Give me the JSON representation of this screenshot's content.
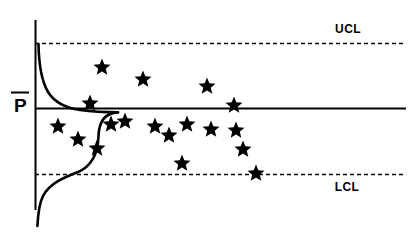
{
  "chart_data": {
    "type": "scatter",
    "title": "",
    "subtitle": "",
    "xlabel": "",
    "ylabel": "",
    "axis": {
      "x_axis_visible": false,
      "y_axis_visible": true,
      "grid": false,
      "xlim": [
        0,
        24
      ],
      "ylim": [
        0,
        1
      ]
    },
    "center_line": {
      "label": "P̅",
      "label_plain": "P-bar",
      "value": 0.5,
      "style": "solid",
      "color": "#000000"
    },
    "control_limits": [
      {
        "name": "UCL",
        "label": "UCL",
        "value": 0.86,
        "style": "dashed",
        "color": "#000000",
        "label_x": 348,
        "label_y": 33
      },
      {
        "name": "LCL",
        "label": "LCL",
        "value": 0.14,
        "style": "dashed",
        "color": "#000000",
        "label_x": 347,
        "label_y": 191
      }
    ],
    "variable_limit_curves": {
      "description": "Control limits widen for small subgroup sizes at the left edge",
      "upper_curve_visible": true,
      "lower_curve_visible": true,
      "color": "#000000",
      "style": "solid"
    },
    "marker": {
      "shape": "star",
      "color": "#000000",
      "size": 9
    },
    "points": [
      {
        "index": 1,
        "x": 102,
        "y": 67,
        "value": 0.7
      },
      {
        "index": 2,
        "x": 143,
        "y": 79,
        "value": 0.64
      },
      {
        "index": 3,
        "x": 90,
        "y": 103,
        "value": 0.53
      },
      {
        "index": 4,
        "x": 207,
        "y": 86,
        "value": 0.6
      },
      {
        "index": 5,
        "x": 125,
        "y": 121,
        "value": 0.45
      },
      {
        "index": 6,
        "x": 58,
        "y": 126,
        "value": 0.43
      },
      {
        "index": 7,
        "x": 78,
        "y": 139,
        "value": 0.37
      },
      {
        "index": 8,
        "x": 97,
        "y": 148,
        "value": 0.33
      },
      {
        "index": 9,
        "x": 111,
        "y": 124,
        "value": 0.44
      },
      {
        "index": 10,
        "x": 155,
        "y": 126,
        "value": 0.43
      },
      {
        "index": 11,
        "x": 169,
        "y": 135,
        "value": 0.39
      },
      {
        "index": 12,
        "x": 187,
        "y": 124,
        "value": 0.44
      },
      {
        "index": 13,
        "x": 211,
        "y": 129,
        "value": 0.42
      },
      {
        "index": 14,
        "x": 182,
        "y": 163,
        "value": 0.25
      },
      {
        "index": 15,
        "x": 234,
        "y": 105,
        "value": 0.51
      },
      {
        "index": 16,
        "x": 236,
        "y": 130,
        "value": 0.42
      },
      {
        "index": 17,
        "x": 243,
        "y": 149,
        "value": 0.33
      },
      {
        "index": 18,
        "x": 256,
        "y": 173,
        "value": 0.14
      }
    ]
  },
  "labels": {
    "ucl": "UCL",
    "lcl": "LCL",
    "center": "P"
  }
}
